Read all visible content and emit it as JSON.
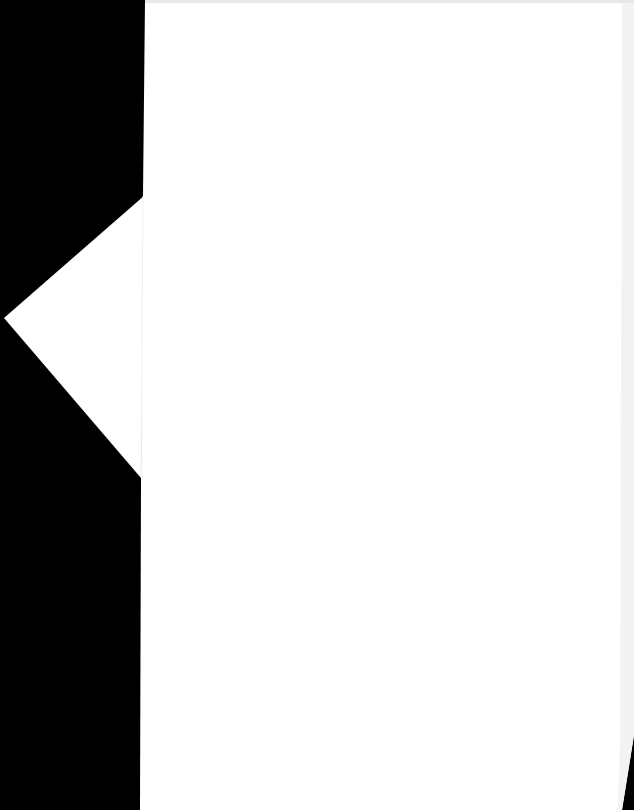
{
  "scene": {
    "description": "Blank white sheet of paper photographed against a black background",
    "colors": {
      "background": "#000000",
      "paper": "#ffffff",
      "paper_edge_shade": "#f2f2f2"
    },
    "elements": {
      "sheet": {
        "visible_text": ""
      },
      "left_flap": {
        "shape": "triangle",
        "visible_text": ""
      }
    }
  }
}
